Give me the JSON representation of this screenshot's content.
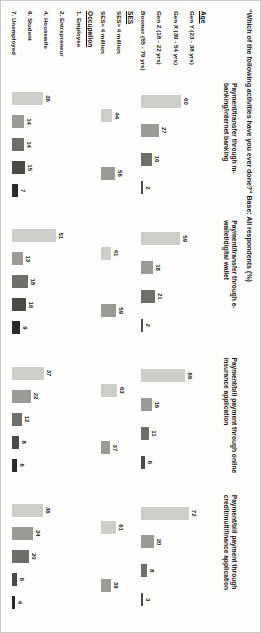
{
  "title": "“Which of the following activities have you ever done?” Base: All respondents (%)",
  "panels": [
    {
      "key": "mbanking",
      "label": "Payment/transfer through m-banking/internet banking"
    },
    {
      "key": "ewallet",
      "label": "Payment/transfer through e-wallet/digital wallet"
    },
    {
      "key": "insurance",
      "label": "Payment/bill payment through online insurance application"
    },
    {
      "key": "creditmulti",
      "label": "Payment/bill payment through credit/multifinance application"
    }
  ],
  "groups": [
    {
      "name": "Age",
      "categories": [
        "Gen Y (23 - 38 yrs)",
        "Gen X (39 - 54 yrs)",
        "Gen Z (18 - 22 yrs)",
        "Boomer (55 - 79 yrs)"
      ]
    },
    {
      "name": "SES",
      "categories": [
        "SES> 4 million",
        "SES< 4 million"
      ]
    },
    {
      "name": "Occupation",
      "categories": [
        "1. Employee",
        "2. Entrepreneur",
        "4. Housewife",
        "6. Student",
        "7. Unemployed"
      ]
    }
  ],
  "colors": {
    "light": "#cdcdc9",
    "mid_light": "#9a9a96",
    "mid": "#6e6e6b",
    "dark": "#4a4a48",
    "darkest": "#2b2b2a"
  },
  "chart_data": {
    "type": "bar",
    "title": "“Which of the following activities have you ever done?” Base: All respondents (%)",
    "xlabel": "",
    "ylabel": "%",
    "ylim": [
      0,
      80
    ],
    "grid": false,
    "legend": "none",
    "panel_labels": [
      "Payment/transfer through m-banking/internet banking",
      "Payment/transfer through e-wallet/digital wallet",
      "Payment/bill payment through online insurance application",
      "Payment/bill payment through credit/multifinance application"
    ],
    "groups": [
      {
        "name": "Age",
        "categories": [
          "Gen Y (23 - 38 yrs)",
          "Gen X (39 - 54 yrs)",
          "Gen Z (18 - 22 yrs)",
          "Boomer (55 - 79 yrs)"
        ],
        "series": [
          {
            "name": "Payment/transfer through m-banking/internet banking",
            "values": [
              60,
              27,
              16,
              2
            ]
          },
          {
            "name": "Payment/transfer through e-wallet/digital wallet",
            "values": [
              59,
              18,
              21,
              2
            ]
          },
          {
            "name": "Payment/bill payment through online insurance application",
            "values": [
              66,
              16,
              11,
              6
            ]
          },
          {
            "name": "Payment/bill payment through credit/multifinance application",
            "values": [
              72,
              20,
              8,
              3
            ]
          }
        ]
      },
      {
        "name": "SES",
        "categories": [
          "SES> 4 million",
          "SES< 4 million"
        ],
        "series": [
          {
            "name": "Payment/transfer through m-banking/internet banking",
            "values": [
              44,
              56
            ]
          },
          {
            "name": "Payment/transfer through e-wallet/digital wallet",
            "values": [
              41,
              59
            ]
          },
          {
            "name": "Payment/bill payment through online insurance application",
            "values": [
              63,
              37
            ]
          },
          {
            "name": "Payment/bill payment through credit/multifinance application",
            "values": [
              61,
              39
            ]
          }
        ]
      },
      {
        "name": "Occupation",
        "categories": [
          "1. Employee",
          "2. Entrepreneur",
          "4. Housewife",
          "6. Student",
          "7. Unemployed"
        ],
        "series": [
          {
            "name": "Payment/transfer through m-banking/internet banking",
            "values": [
              36,
              14,
              14,
              15,
              7
            ]
          },
          {
            "name": "Payment/transfer through e-wallet/digital wallet",
            "values": [
              51,
              13,
              18,
              16,
              9
            ]
          },
          {
            "name": "Payment/bill payment through online insurance application",
            "values": [
              37,
              22,
              12,
              8,
              6
            ]
          },
          {
            "name": "Payment/bill payment through credit/multifinance application",
            "values": [
              36,
              24,
              20,
              6,
              4
            ]
          }
        ]
      }
    ]
  }
}
